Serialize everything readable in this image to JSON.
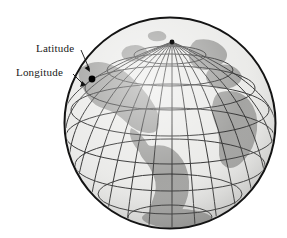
{
  "figure": {
    "type": "globe-diagram",
    "background_color": "#ffffff"
  },
  "labels": {
    "latitude": "Latitude",
    "longitude": "Longitude"
  },
  "globe": {
    "center_x": 170,
    "center_y": 123,
    "radius": 106,
    "ocean_color": "#e8e8e6",
    "land_color": "#9a9a98",
    "grid_color": "#222222",
    "outline_color": "#111111",
    "pole_label": "North Pole",
    "marked_point": {
      "x": 92,
      "y": 79,
      "color": "#000000"
    },
    "latitude_circles": 7,
    "meridian_count": 24
  },
  "callouts": [
    {
      "name": "latitude-callout",
      "label": "Latitude",
      "line": {
        "x1": 81,
        "y1": 50,
        "x2": 90,
        "y2": 70
      },
      "arrow_at": {
        "x": 90,
        "y": 71
      }
    },
    {
      "name": "longitude-callout",
      "label": "Longitude",
      "line": {
        "x1": 73,
        "y1": 74,
        "x2": 84,
        "y2": 85
      },
      "arrow_at": {
        "x": 85,
        "y": 85
      }
    }
  ]
}
